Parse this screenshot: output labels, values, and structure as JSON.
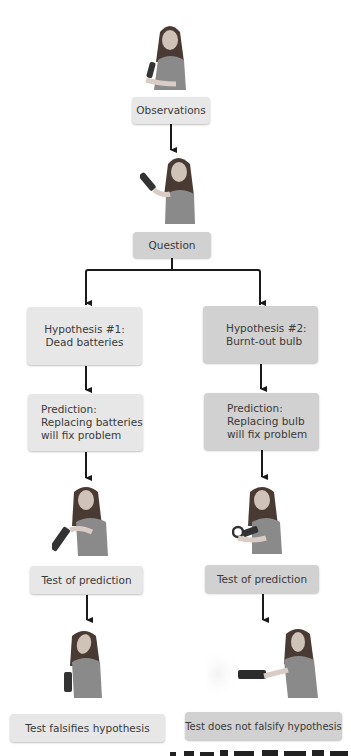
{
  "diagram": {
    "type": "flowchart",
    "colors": {
      "box_light": "#e7e7e7",
      "box_dark": "#d1d1d1",
      "arrow": "#1a1a1a",
      "text": "#3a3a3a"
    },
    "nodes": {
      "observations": "Observations",
      "question": "Question",
      "hypothesis_1": [
        "Hypothesis #1:",
        "Dead batteries"
      ],
      "hypothesis_2": [
        "Hypothesis #2:",
        "Burnt-out bulb"
      ],
      "prediction_1": [
        "Prediction:",
        "Replacing batteries",
        "will fix problem"
      ],
      "prediction_2": [
        "Prediction:",
        "Replacing bulb",
        "will fix problem"
      ],
      "test_1": "Test of prediction",
      "test_2": "Test of prediction",
      "result_1": "Test falsifies hypothesis",
      "result_2": "Test does not falsify hypothesis"
    },
    "illustrations": [
      "woman-holding-flashlight-observing",
      "woman-thinking-with-flashlight",
      "woman-replacing-batteries",
      "woman-replacing-bulb",
      "woman-disappointed-flashlight-off",
      "woman-holding-lit-flashlight"
    ],
    "edges": [
      [
        "observations",
        "question"
      ],
      [
        "question",
        "hypothesis_1"
      ],
      [
        "question",
        "hypothesis_2"
      ],
      [
        "hypothesis_1",
        "prediction_1"
      ],
      [
        "hypothesis_2",
        "prediction_2"
      ],
      [
        "prediction_1",
        "test_1"
      ],
      [
        "prediction_2",
        "test_2"
      ],
      [
        "test_1",
        "result_1"
      ],
      [
        "test_2",
        "result_2"
      ]
    ]
  }
}
